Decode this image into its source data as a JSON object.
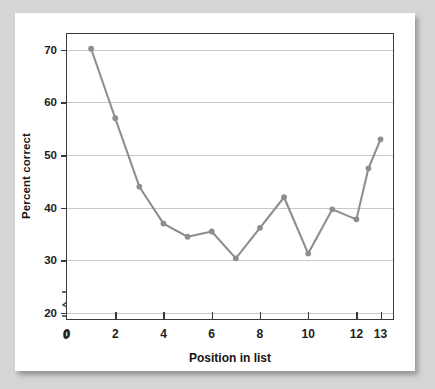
{
  "figure": {
    "background_color": "#d6d5d3",
    "card_color": "#ffffff",
    "series_color": "#8e8e8e",
    "gridline_color": "#c9c9c9",
    "axis_color": "#3a3a3a"
  },
  "chart_data": {
    "type": "line",
    "title": "",
    "xlabel": "Position in list",
    "ylabel": "Percent correct",
    "xlim": [
      0,
      13.6
    ],
    "ylim": [
      18.5,
      73.0
    ],
    "xticks": [
      0,
      2,
      4,
      6,
      8,
      10,
      12,
      13
    ],
    "xticklabels": [
      "0",
      "2",
      "4",
      "6",
      "8",
      "10",
      "12",
      "13"
    ],
    "yticks": [
      20,
      30,
      40,
      50,
      60,
      70
    ],
    "yticklabels": [
      "20",
      "30",
      "40",
      "50",
      "60",
      "70"
    ],
    "grid": "horizontal",
    "legend": "none",
    "y_axis_break": true,
    "y_axis_break_label": "0",
    "x": [
      1,
      2,
      3,
      4,
      5,
      6,
      7,
      8,
      9,
      10,
      11,
      12,
      12.5,
      13
    ],
    "values": [
      70.2,
      57.0,
      44.0,
      37.0,
      34.5,
      35.5,
      30.4,
      36.2,
      42.0,
      31.3,
      39.7,
      37.8,
      47.5,
      53.0
    ],
    "marker": "circle",
    "annotations": [
      {
        "text": "Primacy effect",
        "x": 1.1,
        "y": 72.0
      },
      {
        "text": "Recency effect",
        "x": 10.8,
        "y": 56.5
      }
    ]
  }
}
